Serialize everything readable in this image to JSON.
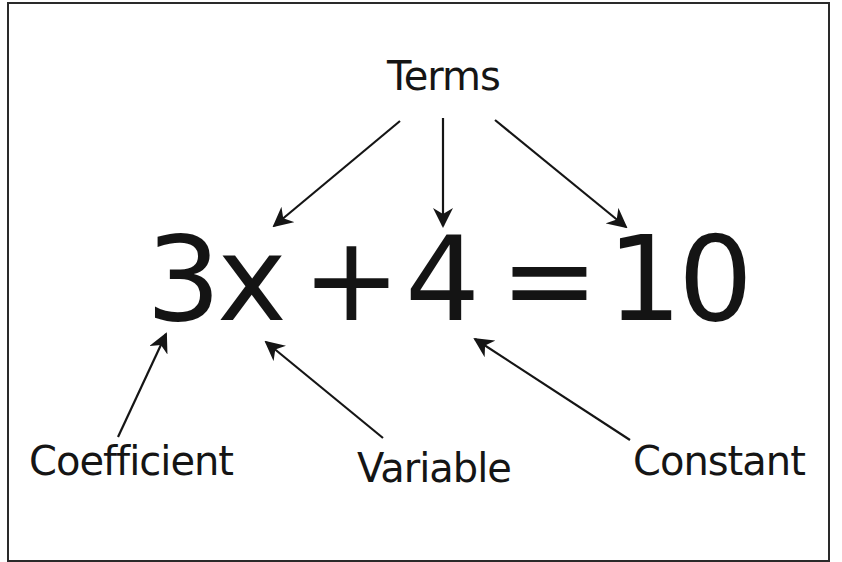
{
  "diagram": {
    "title_label": "Terms",
    "equation": {
      "coefficient_variable": "3x",
      "plus": "+",
      "constant": "4",
      "equals": "=",
      "result": "10",
      "full": "3x + 4 = 10"
    },
    "bottom_labels": {
      "coefficient": "Coefficient",
      "variable": "Variable",
      "constant": "Constant"
    },
    "arrows": [
      {
        "from": "Terms",
        "to": "3x"
      },
      {
        "from": "Terms",
        "to": "4"
      },
      {
        "from": "Terms",
        "to": "10"
      },
      {
        "from": "Coefficient",
        "to": "3"
      },
      {
        "from": "Variable",
        "to": "x"
      },
      {
        "from": "Constant",
        "to": "4"
      }
    ],
    "colors": {
      "ink": "#151515",
      "background": "#ffffff",
      "frame": "#2a2a2a"
    }
  }
}
